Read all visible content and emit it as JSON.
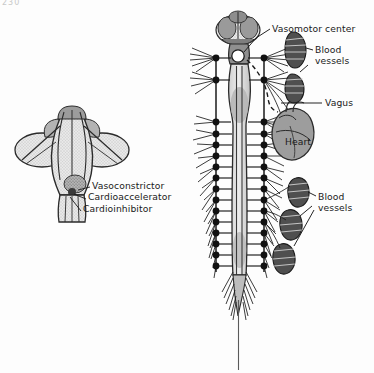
{
  "page": {
    "number": "230",
    "background_color": "#fdfdfd",
    "width": 374,
    "height": 373
  },
  "figure_left": {
    "name": "dorsal-brainstem",
    "description": "Dorsal view of brainstem and medulla showing autonomic centers",
    "labels": [
      {
        "id": "vasoconstrictor",
        "text": "Vasoconstrictor",
        "x": 92,
        "y": 183
      },
      {
        "id": "cardioaccelerator",
        "text": "Cardioaccelerator",
        "x": 88,
        "y": 195
      },
      {
        "id": "cardioinhibitor",
        "text": "Cardioinhibitor",
        "x": 83,
        "y": 207
      }
    ]
  },
  "figure_right": {
    "name": "autonomic-nervous-system",
    "description": "Spinal cord with bilateral sympathetic chains, heart, vagus nerve and blood vessels",
    "labels": [
      {
        "id": "vasomotor-center",
        "text": "Vasomotor center",
        "x": 272,
        "y": 25
      },
      {
        "id": "blood-vessels-upper",
        "text": "Blood vessels",
        "x": 315,
        "y": 52
      },
      {
        "id": "vagus",
        "text": "Vagus",
        "x": 325,
        "y": 102
      },
      {
        "id": "heart",
        "text": "Heart",
        "x": 303,
        "y": 140
      },
      {
        "id": "blood-vessels-lower",
        "text": "Blood vessels",
        "x": 318,
        "y": 198
      }
    ]
  },
  "colors": {
    "ink": "#1a1a1a",
    "organ_fill": "#9d9d9d",
    "cord_fill": "#b9b9b9",
    "vessel_dark": "#4a4a4a",
    "brain_shade": "#c4c4c4",
    "paper": "#fdfdfd"
  },
  "anatomy": {
    "ganglia_per_chain": 18,
    "chain_left_x": 216,
    "chain_right_x": 264,
    "vessel_count_upper": 2,
    "vessel_count_lower": 3
  }
}
